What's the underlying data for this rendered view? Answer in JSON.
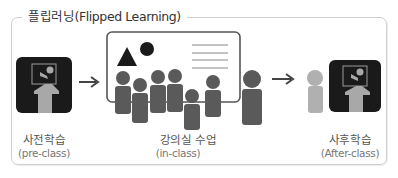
{
  "title": "플립러닝(Flipped Learning)",
  "stages": [
    {
      "label": "사전학습",
      "sublabel": "(pre-class)",
      "icon": "online-lecture-icon"
    },
    {
      "label": "강의실 수업",
      "sublabel": "(in-class)",
      "icon": "classroom-icon"
    },
    {
      "label": "사후학습",
      "sublabel": "(After-class)",
      "icon": "online-review-icon"
    }
  ],
  "colors": {
    "frame": "#cfcfcf",
    "dark": "#1a1a1a",
    "figure": "#5a5a5a",
    "figure_light": "#b0b0b0",
    "screen_figure": "#a8a8a8"
  }
}
